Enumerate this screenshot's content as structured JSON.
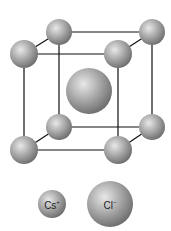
{
  "diagram": {
    "colors": {
      "edge": "#111111",
      "sphere_light": "#e6e6e6",
      "sphere_mid": "#a8a8a8",
      "sphere_dark": "#6e6e6e"
    },
    "corner_atoms": [
      {
        "id": "back-top-left",
        "cx": 59,
        "cy": 32,
        "r": 13
      },
      {
        "id": "back-top-right",
        "cx": 152,
        "cy": 32,
        "r": 13
      },
      {
        "id": "back-bottom-left",
        "cx": 59,
        "cy": 127,
        "r": 13
      },
      {
        "id": "back-bottom-right",
        "cx": 152,
        "cy": 127,
        "r": 13
      },
      {
        "id": "front-top-left",
        "cx": 24,
        "cy": 54,
        "r": 14
      },
      {
        "id": "front-top-right",
        "cx": 118,
        "cy": 54,
        "r": 14
      },
      {
        "id": "front-bottom-left",
        "cx": 24,
        "cy": 150,
        "r": 14
      },
      {
        "id": "front-bottom-right",
        "cx": 118,
        "cy": 150,
        "r": 14
      }
    ],
    "center_atom": {
      "cx": 89,
      "cy": 91,
      "r": 23
    }
  },
  "legend": {
    "cs": {
      "base": "Cs",
      "charge": "+",
      "cx": 52,
      "cy": 204,
      "r": 14
    },
    "cl": {
      "base": "Cl",
      "charge": "−",
      "cx": 110,
      "cy": 204,
      "r": 23
    }
  }
}
